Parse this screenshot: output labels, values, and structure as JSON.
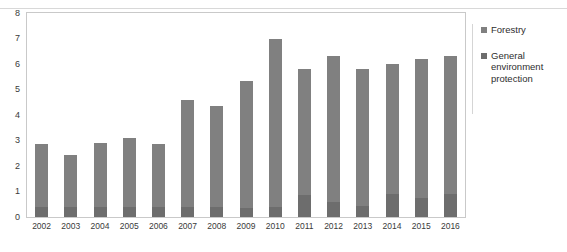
{
  "chart_data": {
    "type": "bar",
    "title": "",
    "subtitle": "",
    "xlabel": "",
    "ylabel": "",
    "stacked": true,
    "grid": false,
    "legend_position": "right",
    "ylim": [
      0,
      8
    ],
    "ytick_labels": [
      "0",
      "1",
      "2",
      "3",
      "4",
      "5",
      "6",
      "7",
      "8"
    ],
    "ytick_values": [
      0,
      1,
      2,
      3,
      4,
      5,
      6,
      7,
      8
    ],
    "categories": [
      "2002",
      "2003",
      "2004",
      "2005",
      "2006",
      "2007",
      "2008",
      "2009",
      "2010",
      "2011",
      "2012",
      "2013",
      "2014",
      "2015",
      "2016"
    ],
    "series": [
      {
        "name": "General environment protection",
        "color": "#6d6d6d",
        "values": [
          0.4,
          0.4,
          0.4,
          0.4,
          0.4,
          0.4,
          0.4,
          0.35,
          0.4,
          0.85,
          0.6,
          0.45,
          0.9,
          0.75,
          0.9
        ]
      },
      {
        "name": "Forestry",
        "color": "#808080",
        "values": [
          2.45,
          2.05,
          2.5,
          2.7,
          2.45,
          4.2,
          3.95,
          5.0,
          6.6,
          4.95,
          5.7,
          5.35,
          5.1,
          5.45,
          5.4
        ]
      }
    ],
    "totals": [
      2.85,
      2.45,
      2.9,
      3.1,
      2.85,
      4.6,
      4.35,
      5.35,
      7.0,
      5.8,
      6.3,
      5.8,
      6.0,
      6.2,
      6.3
    ]
  },
  "legend": {
    "items": [
      {
        "label": "Forestry",
        "color": "#808080"
      },
      {
        "label": "General environment protection",
        "color": "#6d6d6d"
      }
    ]
  }
}
